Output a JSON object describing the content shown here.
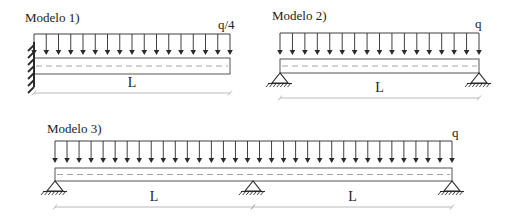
{
  "colors": {
    "ink": "#2a2a2a",
    "beam": "#555555",
    "dash": "#9a9a9a",
    "dim": "#a8a8a8",
    "background": "#ffffff"
  },
  "models": [
    {
      "id": "model-1",
      "title": "Modelo 1)",
      "load_label": "q/4",
      "support_type": "fixed-left",
      "beam": {
        "x1": 34,
        "x2": 230,
        "y_top": 58,
        "y_bot": 74
      },
      "load": {
        "y_line": 34,
        "y_tip": 55,
        "arrow_count": 17
      },
      "spans": [
        {
          "label": "L",
          "x1": 34,
          "x2": 230
        }
      ],
      "dim_y": 93,
      "title_pos": {
        "x": 25,
        "y": 22
      },
      "load_label_pos": {
        "x": 218,
        "y": 29
      },
      "supports_x": []
    },
    {
      "id": "model-2",
      "title": "Modelo 2)",
      "load_label": "q",
      "support_type": "pinned",
      "beam": {
        "x1": 280,
        "x2": 479,
        "y_top": 59,
        "y_bot": 73
      },
      "load": {
        "y_line": 33,
        "y_tip": 55,
        "arrow_count": 17
      },
      "spans": [
        {
          "label": "L",
          "x1": 280,
          "x2": 479
        }
      ],
      "dim_y": 98,
      "title_pos": {
        "x": 272,
        "y": 20
      },
      "load_label_pos": {
        "x": 475,
        "y": 28
      },
      "supports_x": [
        280,
        479
      ]
    },
    {
      "id": "model-3",
      "title": "Modelo 3)",
      "load_label": "q",
      "support_type": "pinned",
      "beam": {
        "x1": 55,
        "x2": 452,
        "y_top": 168,
        "y_bot": 181
      },
      "load": {
        "y_line": 141,
        "y_tip": 163,
        "arrow_count": 34
      },
      "spans": [
        {
          "label": "L",
          "x1": 55,
          "x2": 253
        },
        {
          "label": "L",
          "x1": 253,
          "x2": 452
        }
      ],
      "dim_y": 207,
      "title_pos": {
        "x": 47,
        "y": 133
      },
      "load_label_pos": {
        "x": 452,
        "y": 137
      },
      "supports_x": [
        55,
        253,
        452
      ]
    }
  ]
}
